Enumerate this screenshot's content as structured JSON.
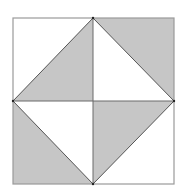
{
  "diagram": {
    "type": "geometric-figure",
    "colors": {
      "background": "#ffffff",
      "shade": "#c6c6c6",
      "stroke": "#555555",
      "outer_stroke": "#9a9a9a"
    },
    "square": {
      "x1": 13,
      "y1": 18,
      "x2": 174,
      "y2": 184
    },
    "center": {
      "x": 93,
      "y": 101
    },
    "shaded_triangles": [
      {
        "name": "top-left-quadrant-triangle",
        "points": "93,18 13,101 93,101"
      },
      {
        "name": "top-right-quadrant-triangle",
        "points": "93,18 174,18 174,101"
      },
      {
        "name": "bottom-left-quadrant-triangle",
        "points": "13,101 13,184 93,184"
      },
      {
        "name": "bottom-right-quadrant-triangle",
        "points": "93,101 174,101 93,184"
      }
    ]
  }
}
